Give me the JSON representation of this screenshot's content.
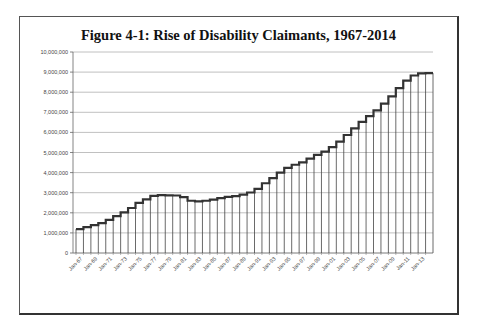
{
  "chart_data": {
    "type": "bar",
    "style": "step",
    "title": "Figure 4-1: Rise of Disability Claimants, 1967-2014",
    "xlabel": "",
    "ylabel": "",
    "ylim": [
      0,
      10000000
    ],
    "grid": true,
    "legend": "none",
    "y_ticks": [
      "0",
      "1,000,000",
      "2,000,000",
      "3,000,000",
      "4,000,000",
      "5,000,000",
      "6,000,000",
      "7,000,000",
      "8,000,000",
      "9,000,000",
      "10,000,000"
    ],
    "x_tick_labels": [
      "Jan-67",
      "Jan-69",
      "Jan-71",
      "Jan-73",
      "Jan-75",
      "Jan-77",
      "Jan-79",
      "Jan-81",
      "Jan-83",
      "Jan-85",
      "Jan-87",
      "Jan-89",
      "Jan-91",
      "Jan-93",
      "Jan-95",
      "Jan-97",
      "Jan-99",
      "Jan-01",
      "Jan-03",
      "Jan-05",
      "Jan-07",
      "Jan-09",
      "Jan-11",
      "Jan-13"
    ],
    "categories": [
      1967,
      1968,
      1969,
      1970,
      1971,
      1972,
      1973,
      1974,
      1975,
      1976,
      1977,
      1978,
      1979,
      1980,
      1981,
      1982,
      1983,
      1984,
      1985,
      1986,
      1987,
      1988,
      1989,
      1990,
      1991,
      1992,
      1993,
      1994,
      1995,
      1996,
      1997,
      1998,
      1999,
      2000,
      2001,
      2002,
      2003,
      2004,
      2005,
      2006,
      2007,
      2008,
      2009,
      2010,
      2011,
      2012,
      2013,
      2014
    ],
    "values": [
      1190000,
      1290000,
      1390000,
      1490000,
      1650000,
      1830000,
      2020000,
      2240000,
      2490000,
      2670000,
      2840000,
      2880000,
      2870000,
      2860000,
      2780000,
      2600000,
      2570000,
      2600000,
      2660000,
      2730000,
      2790000,
      2830000,
      2900000,
      3010000,
      3190000,
      3470000,
      3730000,
      4000000,
      4240000,
      4390000,
      4510000,
      4700000,
      4880000,
      5040000,
      5270000,
      5540000,
      5870000,
      6200000,
      6520000,
      6810000,
      7100000,
      7430000,
      7790000,
      8200000,
      8580000,
      8830000,
      8940000,
      8950000
    ],
    "colors": {
      "line": "#333333",
      "grid": "#b0b0b0",
      "bars": "#444444"
    }
  }
}
